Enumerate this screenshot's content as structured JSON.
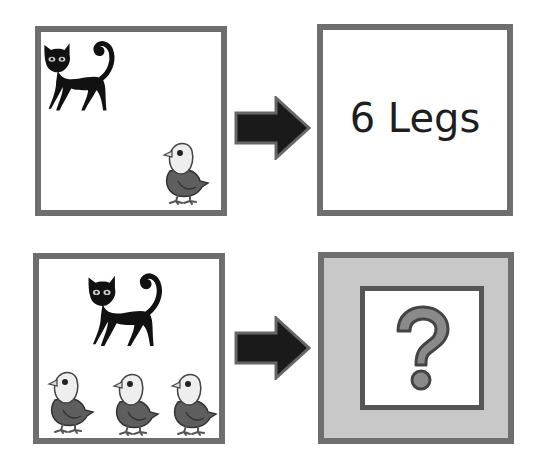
{
  "diagram": {
    "rows": [
      {
        "input": {
          "animals": [
            {
              "kind": "cat",
              "icon": "cat-icon"
            },
            {
              "kind": "bird",
              "icon": "bird-icon"
            }
          ]
        },
        "arrow_icon": "right-arrow-icon",
        "output": {
          "text": "6 Legs"
        }
      },
      {
        "input": {
          "animals": [
            {
              "kind": "cat",
              "icon": "cat-icon"
            },
            {
              "kind": "bird",
              "icon": "bird-icon"
            },
            {
              "kind": "bird",
              "icon": "bird-icon"
            },
            {
              "kind": "bird",
              "icon": "bird-icon"
            }
          ]
        },
        "arrow_icon": "right-arrow-icon",
        "output": {
          "text": "?",
          "icon": "question-mark-icon"
        }
      }
    ],
    "colors": {
      "border": "#6e6e6e",
      "arrow": "#1a1a1a",
      "arrow_outline": "#666666",
      "answer_frame": "#c8c8c8",
      "question_mark": "#8a8a8a"
    }
  }
}
